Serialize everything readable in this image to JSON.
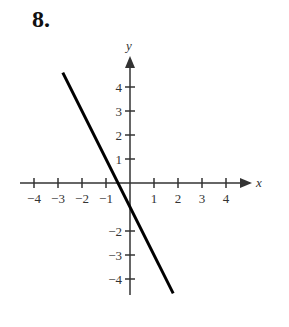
{
  "problem_number": "8.",
  "chart_data": {
    "type": "line",
    "title": "",
    "xlabel": "x",
    "ylabel": "y",
    "xlim": [
      -4,
      4
    ],
    "ylim": [
      -4,
      4
    ],
    "x_ticks": [
      "-4",
      "-3",
      "-2",
      "-1",
      "1",
      "2",
      "3",
      "4"
    ],
    "y_ticks": [
      "4",
      "3",
      "2",
      "1",
      "-2",
      "-3",
      "-4"
    ],
    "series": [
      {
        "name": "y = -2x - 1",
        "x": [
          -2.8,
          1.8
        ],
        "y": [
          4.6,
          -4.6
        ]
      }
    ],
    "grid": false
  }
}
